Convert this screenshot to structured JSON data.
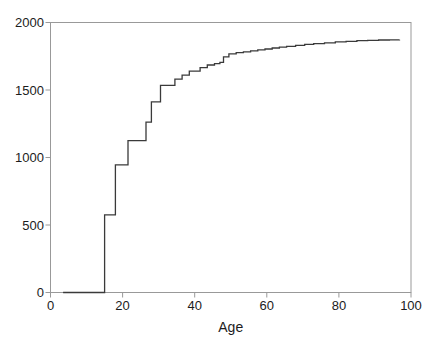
{
  "figure": {
    "background": "#ffffff"
  },
  "chart_data": {
    "type": "line",
    "subtype": "step-after",
    "title": "",
    "xlabel": "Age",
    "ylabel": "",
    "xlim": [
      0,
      100
    ],
    "ylim": [
      0,
      2000
    ],
    "x_ticks": [
      0,
      20,
      40,
      60,
      80,
      100
    ],
    "y_ticks": [
      0,
      500,
      1000,
      1500,
      2000
    ],
    "grid": false,
    "legend": "none",
    "frame_box": true,
    "series": [
      {
        "name": "cumulative-count-by-age",
        "step": "after",
        "points": [
          [
            3.5,
            0
          ],
          [
            15,
            575
          ],
          [
            18,
            945
          ],
          [
            21.5,
            1125
          ],
          [
            26.5,
            1262
          ],
          [
            28,
            1412
          ],
          [
            30.5,
            1535
          ],
          [
            34.5,
            1580
          ],
          [
            36.5,
            1610
          ],
          [
            38.5,
            1640
          ],
          [
            41.5,
            1665
          ],
          [
            43.5,
            1685
          ],
          [
            45.5,
            1695
          ],
          [
            47,
            1705
          ],
          [
            48,
            1745
          ],
          [
            49.5,
            1768
          ],
          [
            51.5,
            1776
          ],
          [
            53.5,
            1783
          ],
          [
            55.5,
            1790
          ],
          [
            57.5,
            1797
          ],
          [
            59.5,
            1804
          ],
          [
            61.5,
            1811
          ],
          [
            63.5,
            1818
          ],
          [
            65.5,
            1824
          ],
          [
            68,
            1831
          ],
          [
            70.5,
            1838
          ],
          [
            73,
            1844
          ],
          [
            76,
            1850
          ],
          [
            79,
            1856
          ],
          [
            82,
            1861
          ],
          [
            85,
            1865
          ],
          [
            88,
            1868
          ],
          [
            91,
            1870
          ],
          [
            94,
            1871
          ],
          [
            96.8,
            1872
          ]
        ]
      }
    ],
    "colors": {
      "line": "#3a3a3a",
      "frame": "#999999",
      "tick": "#999999",
      "text": "#1c1c1c",
      "background": "#ffffff"
    }
  }
}
